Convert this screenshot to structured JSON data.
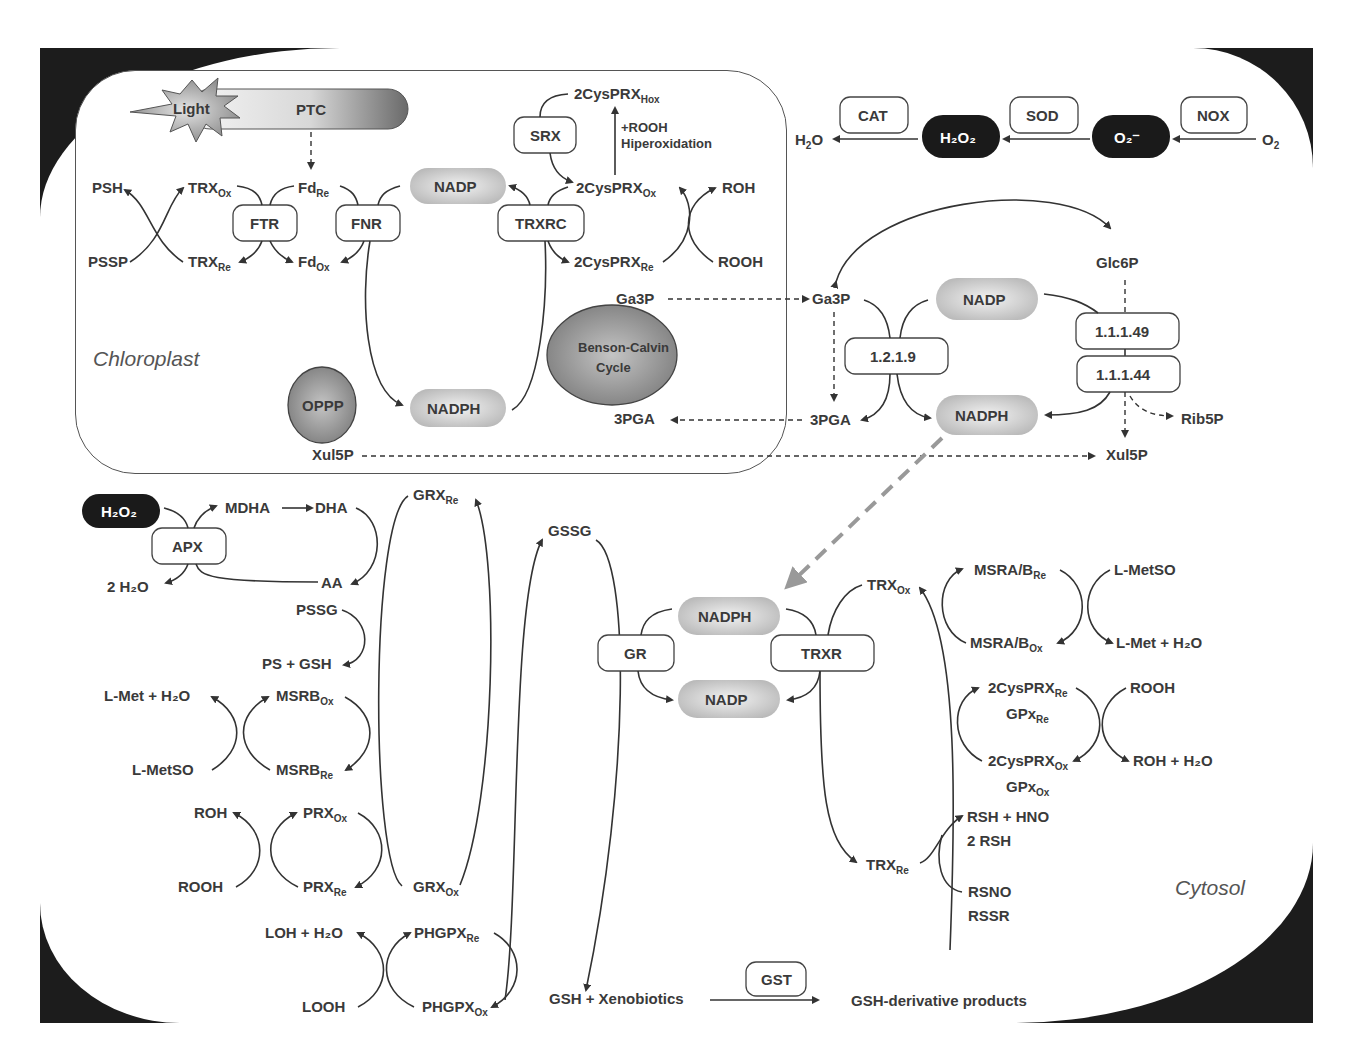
{
  "regions": {
    "chloroplast": "Chloroplast",
    "cytosol": "Cytosol"
  },
  "chloroplast": {
    "light": "Light",
    "ptc": "PTC",
    "psh": "PSH",
    "pssp": "PSSP",
    "trx_ox": "TRX",
    "trx_ox_sub": "Ox",
    "trx_re": "TRX",
    "trx_re_sub": "Re",
    "fd_re": "Fd",
    "fd_re_sub": "Re",
    "fd_ox": "Fd",
    "fd_ox_sub": "Ox",
    "ftr": "FTR",
    "fnr": "FNR",
    "nadp": "NADP",
    "nadph": "NADPH",
    "trxrc": "TRXRC",
    "srx": "SRX",
    "prx_hox": "2CysPRX",
    "prx_hox_sub": "Hox",
    "hiperox_1": "+ROOH",
    "hiperox_2": "Hiperoxidation",
    "prx_ox": "2CysPRX",
    "prx_ox_sub": "Ox",
    "prx_re": "2CysPRX",
    "prx_re_sub": "Re",
    "roh": "ROH",
    "rooh": "ROOH",
    "ga3p": "Ga3P",
    "pga3": "3PGA",
    "benson_1": "Benson-Calvin",
    "benson_2": "Cycle",
    "oppp": "OPPP",
    "xul5p": "Xul5P"
  },
  "ros_chain": {
    "h2o": "H",
    "h2o_sub": "2",
    "h2o_tail": "O",
    "cat": "CAT",
    "h2o2": "H₂O₂",
    "sod": "SOD",
    "o2_radical": "O₂⁻",
    "nox": "NOX",
    "o2": "O",
    "o2_sub": "2"
  },
  "cytosol_oppp": {
    "glc6p": "Glc6P",
    "ga3p": "Ga3P",
    "nadp": "NADP",
    "enz_1219": "1.2.1.9",
    "enz_11149": "1.1.1.49",
    "enz_11144": "1.1.1.44",
    "pga3": "3PGA",
    "nadph": "NADPH",
    "rib5p": "Rib5P",
    "xul5p": "Xul5P"
  },
  "ascorbate": {
    "h2o2": "H₂O₂",
    "apx": "APX",
    "mdha": "MDHA",
    "dha": "DHA",
    "aa": "AA",
    "two_h2o": "2 H₂O"
  },
  "grx_side": {
    "grx_re": "GRX",
    "grx_re_sub": "Re",
    "grx_ox": "GRX",
    "grx_ox_sub": "Ox",
    "pssg": "PSSG",
    "ps_gsh": "PS + GSH",
    "lmet_h2o": "L-Met + H₂O",
    "msrb_ox": "MSRB",
    "msrb_ox_sub": "Ox",
    "lmetso": "L-MetSO",
    "msrb_re": "MSRB",
    "msrb_re_sub": "Re",
    "roh": "ROH",
    "prx_ox": "PRX",
    "prx_ox_sub": "Ox",
    "rooh": "ROOH",
    "prx_re": "PRX",
    "prx_re_sub": "Re",
    "loh_h2o": "LOH + H₂O",
    "phgpx_re": "PHGPX",
    "phgpx_re_sub": "Re",
    "looh": "LOOH",
    "phgpx_ox": "PHGPX",
    "phgpx_ox_sub": "Ox"
  },
  "center": {
    "gssg": "GSSG",
    "gr": "GR",
    "nadph": "NADPH",
    "nadp": "NADP",
    "trxr": "TRXR",
    "gsh_xeno": "GSH  +  Xenobiotics",
    "gst": "GST",
    "gsh_products": "GSH-derivative products"
  },
  "trx_side": {
    "trx_ox": "TRX",
    "trx_ox_sub": "Ox",
    "trx_re": "TRX",
    "trx_re_sub": "Re",
    "msra_re": "MSRA/B",
    "msra_re_sub": "Re",
    "msra_ox": "MSRA/B",
    "msra_ox_sub": "Ox",
    "lmetso": "L-MetSO",
    "lmet_h2o": "L-Met + H₂O",
    "prx_re": "2CysPRX",
    "prx_re_sub": "Re",
    "gpx_re": "GPx",
    "gpx_re_sub": "Re",
    "prx_ox": "2CysPRX",
    "prx_ox_sub": "Ox",
    "gpx_ox": "GPx",
    "gpx_ox_sub": "Ox",
    "rooh": "ROOH",
    "roh_h2o": "ROH + H₂O",
    "rsh_hno": "RSH + HNO",
    "two_rsh": "2 RSH",
    "rsno": "RSNO",
    "rssr": "RSSR"
  },
  "colors": {
    "frame": "#1c1c1c",
    "text": "#3a3a3a",
    "pill_grey": "#c8c8c8",
    "dashed_arrow": "#999999"
  }
}
